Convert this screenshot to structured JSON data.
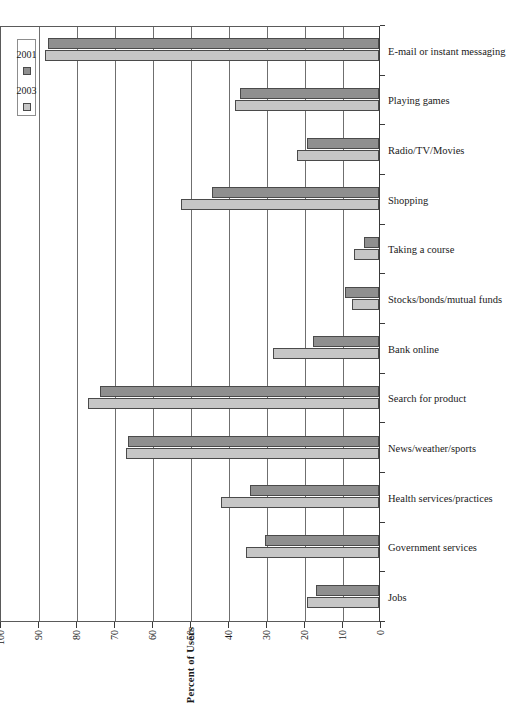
{
  "chart_data": {
    "type": "bar",
    "title": "",
    "subtitle": "",
    "orientation": "vertical-bars-rotated-90ccw",
    "xlabel": "",
    "ylabel": "Percent of Users",
    "ylim": [
      0,
      100
    ],
    "ytick_labels": [
      "0",
      "10",
      "20",
      "30",
      "40",
      "50",
      "60",
      "70",
      "80",
      "90",
      "100"
    ],
    "ytick_values": [
      0,
      10,
      20,
      30,
      40,
      50,
      60,
      70,
      80,
      90,
      100
    ],
    "grid": "horizontal-gridlines-at-major-ticks",
    "legend_position": "top-left-inside-plot",
    "categories": [
      "Jobs",
      "Government services",
      "Health services/practices",
      "News/weather/sports",
      "Search for product",
      "Bank online",
      "Stocks/bonds/mutual funds",
      "Taking a course",
      "Shopping",
      "Radio/TV/Movies",
      "Playing games",
      "E-mail or instant messaging"
    ],
    "series": [
      {
        "name": "2003",
        "color": "#c6c6c6",
        "values": [
          19,
          35,
          41.5,
          66.5,
          76.5,
          28,
          7,
          6.5,
          52,
          21.5,
          38,
          88
        ]
      },
      {
        "name": "2001",
        "color": "#8f8f8f",
        "values": [
          16.5,
          30,
          34,
          66,
          73.5,
          17.5,
          9,
          4,
          44,
          19,
          36.5,
          87
        ]
      }
    ]
  },
  "legend": {
    "entries": [
      {
        "label": "2003",
        "series": "s2003"
      },
      {
        "label": "2001",
        "series": "s2001"
      }
    ]
  },
  "axis": {
    "value_axis_title": "Percent of Users"
  }
}
